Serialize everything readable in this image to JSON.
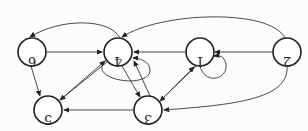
{
  "diagram": {
    "type": "directed-graph",
    "orientation": "rotated-180",
    "nodes": [
      {
        "id": "6",
        "label": "6",
        "x": 32,
        "y": 52
      },
      {
        "id": "4",
        "label": "4",
        "x": 118,
        "y": 52
      },
      {
        "id": "1",
        "label": "1",
        "x": 200,
        "y": 52
      },
      {
        "id": "2",
        "label": "2",
        "x": 287,
        "y": 52
      },
      {
        "id": "5",
        "label": "5",
        "x": 48,
        "y": 110
      },
      {
        "id": "3",
        "label": "3",
        "x": 148,
        "y": 110
      }
    ]
  }
}
